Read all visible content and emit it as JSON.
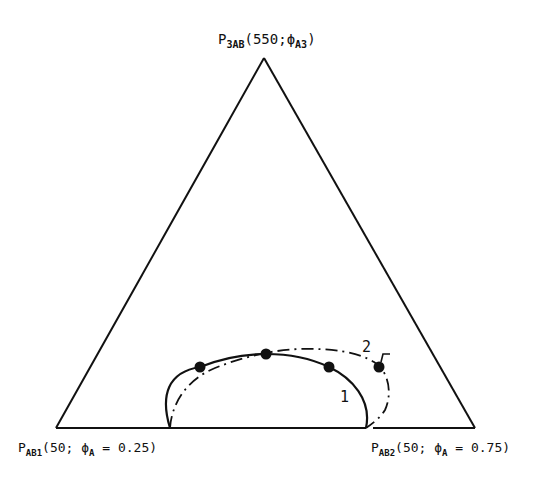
{
  "diagram": {
    "type": "ternary-phase-diagram",
    "vertices": {
      "top": {
        "main": "P",
        "sub": "3AB",
        "rest_prefix": "(550;",
        "phi": "ϕ",
        "phi_sub": "A3",
        "rest_suffix": ")"
      },
      "bottom_left": {
        "main": "P",
        "sub": "AB1",
        "rest_prefix": "(50; ",
        "phi": "ϕ",
        "phi_sub": "A",
        "rest_suffix": " = 0.25)"
      },
      "bottom_right": {
        "main": "P",
        "sub": "AB2",
        "rest_prefix": "(50; ",
        "phi": "ϕ",
        "phi_sub": "A",
        "rest_suffix": " = 0.75)"
      }
    },
    "curves": [
      {
        "id": "1",
        "label": "1",
        "style": "solid"
      },
      {
        "id": "2",
        "label": "2",
        "style": "dash-dot"
      }
    ],
    "points": [
      {
        "x": 200,
        "y": 367
      },
      {
        "x": 266,
        "y": 354
      },
      {
        "x": 329,
        "y": 367
      },
      {
        "x": 379,
        "y": 367
      }
    ],
    "colors": {
      "line": "#111111",
      "background": "#ffffff"
    }
  }
}
